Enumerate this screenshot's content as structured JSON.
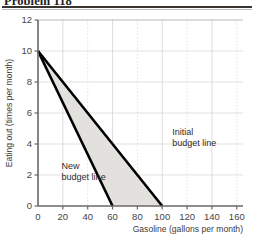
{
  "title": "Problem 118",
  "chart_data": {
    "type": "line",
    "title": "Problem 118",
    "xlabel": "Gasoline (gallons per month)",
    "ylabel": "Eating out (times per month)",
    "xlim": [
      0,
      165
    ],
    "ylim": [
      0,
      12
    ],
    "xticks": [
      0,
      20,
      40,
      60,
      80,
      100,
      120,
      140,
      160
    ],
    "yticks": [
      0,
      2,
      4,
      6,
      8,
      10,
      12
    ],
    "xtick_labels": [
      "0",
      "20",
      "40",
      "60",
      "80",
      "100",
      "120",
      "140",
      "160"
    ],
    "ytick_labels": [
      "0",
      "2",
      "4",
      "6",
      "8",
      "10",
      "12"
    ],
    "grid": true,
    "legend": "none",
    "series": [
      {
        "name": "Initial budget line",
        "x": [
          0,
          100
        ],
        "y": [
          10,
          0
        ],
        "color": "#000000",
        "style": "solid",
        "width": 2.6
      },
      {
        "name": "New budget line",
        "x": [
          0,
          60
        ],
        "y": [
          10,
          0
        ],
        "color": "#000000",
        "style": "solid",
        "width": 2.6
      }
    ],
    "shaded_region": {
      "name": "area-between-budget-lines",
      "vertices": [
        [
          0,
          10
        ],
        [
          100,
          0
        ],
        [
          60,
          0
        ]
      ],
      "fill": "#e2e1de"
    },
    "annotations": [
      {
        "name": "initial-budget-line-label",
        "lines": [
          "Initial",
          "budget line"
        ],
        "x": 108,
        "y": 4.6
      },
      {
        "name": "new-budget-line-label",
        "lines": [
          "New",
          "budget line"
        ],
        "x": 19,
        "y": 2.4
      }
    ]
  },
  "axis": {
    "x_title": "Gasoline (gallons per month)",
    "y_title": "Eating out (times per month)"
  },
  "colors": {
    "line": "#000000",
    "shade": "#e2e1de",
    "grid": "#d6d4d0",
    "axis": "#6d6763",
    "rule": "#3a3431",
    "text": "#3f3a38"
  }
}
